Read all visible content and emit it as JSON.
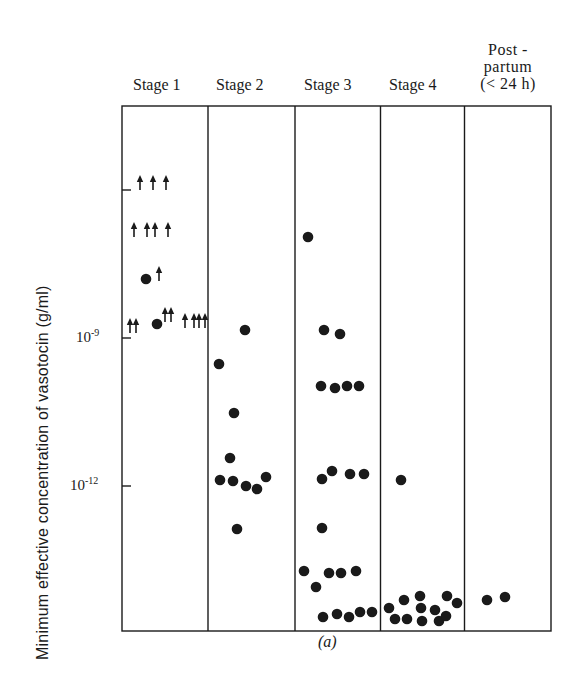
{
  "chart_data": {
    "type": "scatter",
    "title": "",
    "caption": "(a)",
    "xlabel": "",
    "ylabel": "Minimum effective concentration of vasotocin (g/ml)",
    "yscale": "log",
    "y_tick_labels": [
      {
        "label": "10",
        "exp": "-9",
        "value": 1e-09,
        "pixel_y": 338
      },
      {
        "label": "10",
        "exp": "-12",
        "value": 1e-12,
        "pixel_y": 486
      }
    ],
    "y_unlabeled_tick": {
      "value": 1e-06,
      "pixel_y": 190
    },
    "ylim_log10": [
      -14.9,
      -4.3
    ],
    "grid": false,
    "legend": null,
    "categories": [
      "Stage 1",
      "Stage 2",
      "Stage 3",
      "Stage 4",
      "Post-partum (<24 h)"
    ],
    "marker_legend": {
      "dot": "measured minimum effective concentration",
      "arrow": "greater than (no response at highest dose)"
    },
    "series": [
      {
        "name": "Stage 1",
        "points": [
          {
            "px": 140,
            "py": 182,
            "log10": -5.8,
            "marker": "arrow"
          },
          {
            "px": 153,
            "py": 182,
            "log10": -5.8,
            "marker": "arrow"
          },
          {
            "px": 166,
            "py": 182,
            "log10": -5.8,
            "marker": "arrow"
          },
          {
            "px": 134,
            "py": 229,
            "log10": -6.8,
            "marker": "arrow"
          },
          {
            "px": 147,
            "py": 229,
            "log10": -6.8,
            "marker": "arrow"
          },
          {
            "px": 155,
            "py": 229,
            "log10": -6.8,
            "marker": "arrow"
          },
          {
            "px": 168,
            "py": 229,
            "log10": -6.8,
            "marker": "arrow"
          },
          {
            "px": 146,
            "py": 279,
            "log10": -7.8,
            "marker": "dot"
          },
          {
            "px": 159,
            "py": 273,
            "log10": -7.7,
            "marker": "arrow"
          },
          {
            "px": 130,
            "py": 325,
            "log10": -8.7,
            "marker": "arrow"
          },
          {
            "px": 136,
            "py": 325,
            "log10": -8.7,
            "marker": "arrow"
          },
          {
            "px": 157,
            "py": 324,
            "log10": -8.7,
            "marker": "dot"
          },
          {
            "px": 165,
            "py": 314,
            "log10": -8.5,
            "marker": "arrow"
          },
          {
            "px": 171,
            "py": 314,
            "log10": -8.5,
            "marker": "arrow"
          },
          {
            "px": 185,
            "py": 320,
            "log10": -8.6,
            "marker": "arrow"
          },
          {
            "px": 194,
            "py": 320,
            "log10": -8.6,
            "marker": "arrow"
          },
          {
            "px": 199,
            "py": 320,
            "log10": -8.6,
            "marker": "arrow"
          },
          {
            "px": 205,
            "py": 320,
            "log10": -8.6,
            "marker": "arrow"
          }
        ]
      },
      {
        "name": "Stage 2",
        "points": [
          {
            "px": 245,
            "py": 330,
            "log10": -8.8,
            "marker": "dot"
          },
          {
            "px": 219,
            "py": 364,
            "log10": -9.5,
            "marker": "dot"
          },
          {
            "px": 234,
            "py": 413,
            "log10": -10.5,
            "marker": "dot"
          },
          {
            "px": 230,
            "py": 458,
            "log10": -11.4,
            "marker": "dot"
          },
          {
            "px": 220,
            "py": 480,
            "log10": -11.9,
            "marker": "dot"
          },
          {
            "px": 233,
            "py": 481,
            "log10": -11.9,
            "marker": "dot"
          },
          {
            "px": 246,
            "py": 486,
            "log10": -12.0,
            "marker": "dot"
          },
          {
            "px": 257,
            "py": 489,
            "log10": -12.1,
            "marker": "dot"
          },
          {
            "px": 266,
            "py": 477,
            "log10": -11.8,
            "marker": "dot"
          },
          {
            "px": 237,
            "py": 529,
            "log10": -12.9,
            "marker": "dot"
          }
        ]
      },
      {
        "name": "Stage 3",
        "points": [
          {
            "px": 308,
            "py": 237,
            "log10": -7.0,
            "marker": "dot"
          },
          {
            "px": 324,
            "py": 330,
            "log10": -8.8,
            "marker": "dot"
          },
          {
            "px": 340,
            "py": 334,
            "log10": -8.9,
            "marker": "dot"
          },
          {
            "px": 321,
            "py": 386,
            "log10": -10.0,
            "marker": "dot"
          },
          {
            "px": 335,
            "py": 388,
            "log10": -10.0,
            "marker": "dot"
          },
          {
            "px": 347,
            "py": 386,
            "log10": -10.0,
            "marker": "dot"
          },
          {
            "px": 359,
            "py": 386,
            "log10": -10.0,
            "marker": "dot"
          },
          {
            "px": 322,
            "py": 479,
            "log10": -11.9,
            "marker": "dot"
          },
          {
            "px": 332,
            "py": 471,
            "log10": -11.7,
            "marker": "dot"
          },
          {
            "px": 350,
            "py": 474,
            "log10": -11.8,
            "marker": "dot"
          },
          {
            "px": 364,
            "py": 474,
            "log10": -11.8,
            "marker": "dot"
          },
          {
            "px": 322,
            "py": 528,
            "log10": -12.9,
            "marker": "dot"
          },
          {
            "px": 304,
            "py": 571,
            "log10": -13.7,
            "marker": "dot"
          },
          {
            "px": 316,
            "py": 587,
            "log10": -14.0,
            "marker": "dot"
          },
          {
            "px": 329,
            "py": 573,
            "log10": -13.8,
            "marker": "dot"
          },
          {
            "px": 341,
            "py": 573,
            "log10": -13.8,
            "marker": "dot"
          },
          {
            "px": 356,
            "py": 571,
            "log10": -13.7,
            "marker": "dot"
          },
          {
            "px": 323,
            "py": 617,
            "log10": -14.7,
            "marker": "dot"
          },
          {
            "px": 337,
            "py": 614,
            "log10": -14.6,
            "marker": "dot"
          },
          {
            "px": 349,
            "py": 617,
            "log10": -14.7,
            "marker": "dot"
          },
          {
            "px": 360,
            "py": 612,
            "log10": -14.6,
            "marker": "dot"
          },
          {
            "px": 372,
            "py": 612,
            "log10": -14.6,
            "marker": "dot"
          }
        ]
      },
      {
        "name": "Stage 4",
        "points": [
          {
            "px": 401,
            "py": 480,
            "log10": -11.9,
            "marker": "dot"
          },
          {
            "px": 389,
            "py": 608,
            "log10": -14.5,
            "marker": "dot"
          },
          {
            "px": 404,
            "py": 600,
            "log10": -14.3,
            "marker": "dot"
          },
          {
            "px": 395,
            "py": 619,
            "log10": -14.7,
            "marker": "dot"
          },
          {
            "px": 407,
            "py": 619,
            "log10": -14.7,
            "marker": "dot"
          },
          {
            "px": 420,
            "py": 596,
            "log10": -14.2,
            "marker": "dot"
          },
          {
            "px": 421,
            "py": 608,
            "log10": -14.5,
            "marker": "dot"
          },
          {
            "px": 422,
            "py": 621,
            "log10": -14.7,
            "marker": "dot"
          },
          {
            "px": 435,
            "py": 610,
            "log10": -14.5,
            "marker": "dot"
          },
          {
            "px": 439,
            "py": 621,
            "log10": -14.7,
            "marker": "dot"
          },
          {
            "px": 446,
            "py": 616,
            "log10": -14.6,
            "marker": "dot"
          },
          {
            "px": 447,
            "py": 596,
            "log10": -14.2,
            "marker": "dot"
          },
          {
            "px": 457,
            "py": 603,
            "log10": -14.4,
            "marker": "dot"
          }
        ]
      },
      {
        "name": "Post-partum (<24 h)",
        "points": [
          {
            "px": 487,
            "py": 600,
            "log10": -14.3,
            "marker": "dot"
          },
          {
            "px": 505,
            "py": 597,
            "log10": -14.3,
            "marker": "dot"
          }
        ]
      }
    ]
  },
  "labels": {
    "stage1": "Stage 1",
    "stage2": "Stage 2",
    "stage3": "Stage 3",
    "stage4": "Stage 4",
    "post_line1": "Post -",
    "post_line2": "partum",
    "post_line3": "(< 24 h)",
    "ylabel": "Minimum effective concentration of vasotocin (g/ml)",
    "tick_9_base": "10",
    "tick_9_exp": "-9",
    "tick_12_base": "10",
    "tick_12_exp": "-12",
    "caption": "(a)"
  },
  "colors": {
    "ink": "#1a1a1a",
    "background": "#ffffff"
  }
}
